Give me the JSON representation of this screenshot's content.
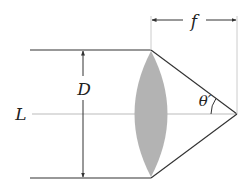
{
  "diagram": {
    "labels": {
      "diameter": "D",
      "axis": "L",
      "focal_length": "f",
      "angle": "θ′"
    },
    "colors": {
      "lines": "#333333",
      "axis": "#bbbbbb",
      "lens_fill": "#b3b3b3",
      "extension_lines": "#cccccc"
    },
    "elements": [
      {
        "id": "top-ray",
        "kind": "line"
      },
      {
        "id": "bottom-ray",
        "kind": "line"
      },
      {
        "id": "optical-axis",
        "kind": "line"
      },
      {
        "id": "lens",
        "kind": "biconvex-lens"
      },
      {
        "id": "diameter-arrow",
        "kind": "double-arrow"
      },
      {
        "id": "focal-length-dimension",
        "kind": "dimension"
      },
      {
        "id": "angle-arc",
        "kind": "arc"
      }
    ]
  }
}
